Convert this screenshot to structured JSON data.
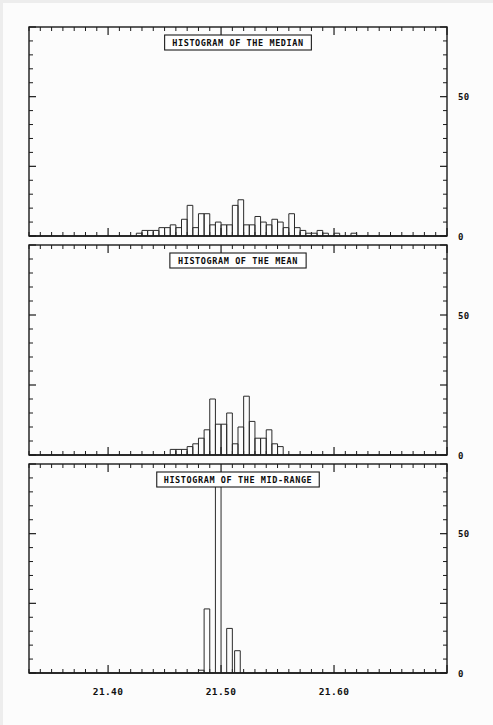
{
  "page": {
    "width": 493,
    "height": 725,
    "background": "#fcfcfc",
    "ink": "#1a1a1a"
  },
  "xaxis": {
    "labels": [
      "21.40",
      "21.50",
      "21.60"
    ],
    "label_x_px": [
      168,
      245,
      322
    ],
    "range": [
      21.33,
      21.7
    ],
    "major_step": 0.1,
    "minor_step": 0.01
  },
  "yaxis": {
    "labels": [
      "50",
      "0"
    ],
    "range": [
      0,
      75
    ],
    "major_ticks": [
      0,
      50
    ]
  },
  "panels": [
    {
      "id": "median",
      "title": "HISTOGRAM OF THE MEDIAN",
      "y_top": 27,
      "y_bottom": 236
    },
    {
      "id": "mean",
      "title": "HISTOGRAM OF THE MEAN",
      "y_top": 245,
      "y_bottom": 455
    },
    {
      "id": "midrange",
      "title": "HISTOGRAM OF THE MID-RANGE",
      "y_top": 464,
      "y_bottom": 673
    }
  ],
  "chart_data": [
    {
      "type": "bar",
      "id": "median",
      "title": "HISTOGRAM OF THE MEDIAN",
      "xlabel": "",
      "ylabel": "",
      "xlim": [
        21.33,
        21.7
      ],
      "ylim": [
        0,
        75
      ],
      "grid": false,
      "legend": false,
      "bin_width": 0.005,
      "bin_starts": [
        21.425,
        21.43,
        21.435,
        21.44,
        21.445,
        21.45,
        21.455,
        21.46,
        21.465,
        21.47,
        21.475,
        21.48,
        21.485,
        21.49,
        21.495,
        21.5,
        21.505,
        21.51,
        21.515,
        21.52,
        21.525,
        21.53,
        21.535,
        21.54,
        21.545,
        21.55,
        21.555,
        21.56,
        21.565,
        21.57,
        21.575,
        21.58,
        21.585,
        21.59,
        21.6,
        21.615
      ],
      "values": [
        1,
        2,
        2,
        2,
        3,
        3,
        4,
        3,
        6,
        11,
        3,
        8,
        8,
        4,
        5,
        4,
        4,
        11,
        13,
        4,
        4,
        7,
        5,
        4,
        6,
        5,
        3,
        8,
        3,
        2,
        1,
        1,
        2,
        1,
        1,
        1
      ]
    },
    {
      "type": "bar",
      "id": "mean",
      "title": "HISTOGRAM OF THE MEAN",
      "xlabel": "",
      "ylabel": "",
      "xlim": [
        21.33,
        21.7
      ],
      "ylim": [
        0,
        75
      ],
      "grid": false,
      "legend": false,
      "bin_width": 0.005,
      "bin_starts": [
        21.455,
        21.46,
        21.465,
        21.47,
        21.475,
        21.48,
        21.485,
        21.49,
        21.495,
        21.5,
        21.505,
        21.51,
        21.515,
        21.52,
        21.525,
        21.53,
        21.535,
        21.54,
        21.545,
        21.55
      ],
      "values": [
        2,
        2,
        2,
        3,
        4,
        6,
        9,
        20,
        11,
        11,
        15,
        4,
        10,
        21,
        12,
        6,
        6,
        9,
        4,
        3,
        2
      ]
    },
    {
      "type": "bar",
      "id": "midrange",
      "title": "HISTOGRAM OF THE MID-RANGE",
      "xlabel": "",
      "ylabel": "",
      "xlim": [
        21.33,
        21.7
      ],
      "ylim": [
        0,
        75
      ],
      "grid": false,
      "legend": false,
      "bin_width": 0.005,
      "bin_starts": [
        21.48,
        21.485,
        21.495,
        21.505,
        21.512
      ],
      "values": [
        1,
        23,
        72,
        16,
        8
      ]
    }
  ]
}
